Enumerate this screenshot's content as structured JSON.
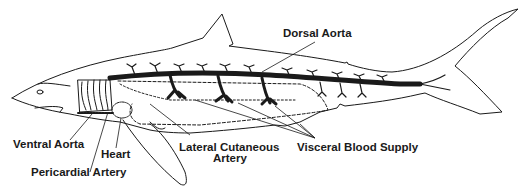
{
  "diagram": {
    "colors": {
      "ink": "#1a1a1a",
      "background": "#ffffff"
    },
    "labels": {
      "dorsal_aorta": "Dorsal Aorta",
      "ventral_aorta": "Ventral Aorta",
      "heart": "Heart",
      "pericardial_artery": "Pericardial Artery",
      "lateral_cutaneous_artery_line1": "Lateral Cutaneous",
      "lateral_cutaneous_artery_line2": "Artery",
      "visceral_blood_supply": "Visceral Blood Supply"
    }
  }
}
